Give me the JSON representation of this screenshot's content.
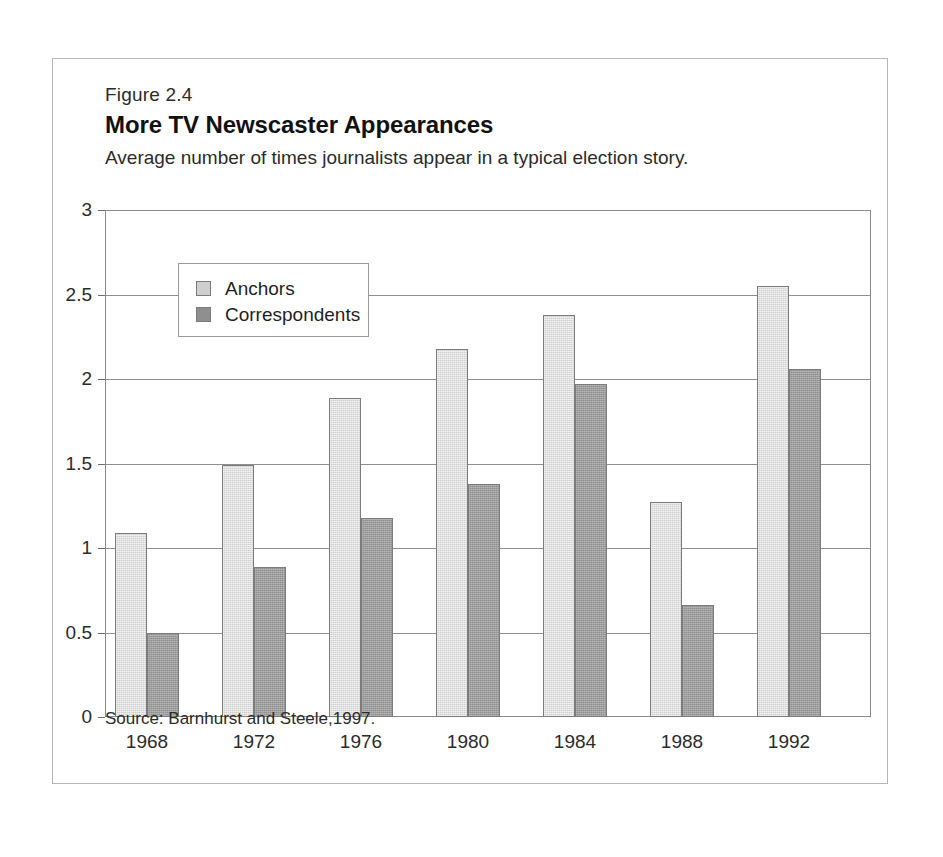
{
  "figure": {
    "number": "Figure 2.4",
    "title": "More TV Newscaster Appearances",
    "subtitle": "Average number of times journalists appear in a typical election story.",
    "source": "Source: Barnhurst and Steele,1997."
  },
  "legend": {
    "position": "inside-top-left",
    "entries": [
      {
        "label": "Anchors",
        "color": "#cfcfcf"
      },
      {
        "label": "Correspondents",
        "color": "#8f8f8f"
      }
    ]
  },
  "chart_data": {
    "type": "bar",
    "title": "More TV Newscaster Appearances",
    "subtitle": "Average number of times journalists appear in a typical election story.",
    "xlabel": "",
    "ylabel": "",
    "categories": [
      "1968",
      "1972",
      "1976",
      "1980",
      "1984",
      "1988",
      "1992"
    ],
    "series": [
      {
        "name": "Anchors",
        "color": "#cfcfcf",
        "values": [
          1.09,
          1.49,
          1.89,
          2.18,
          2.38,
          1.27,
          2.55
        ]
      },
      {
        "name": "Correspondents",
        "color": "#8f8f8f",
        "values": [
          0.5,
          0.89,
          1.18,
          1.38,
          1.97,
          0.66,
          2.06
        ]
      }
    ],
    "ylim": [
      0,
      3
    ],
    "yticks": [
      0,
      0.5,
      1,
      1.5,
      2,
      2.5,
      3
    ],
    "ytick_labels": [
      "0",
      "0.5",
      "1",
      "1.5",
      "2",
      "2.5",
      "3"
    ],
    "grid": true,
    "legend_position": "upper left"
  }
}
